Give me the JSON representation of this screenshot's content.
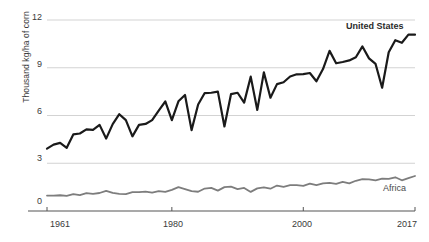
{
  "chart_data": {
    "type": "line",
    "title": "",
    "subtitle": "",
    "xlabel": "",
    "ylabel": "Thousand kg/ha of corn",
    "xlim": [
      1961,
      2017
    ],
    "ylim": [
      0,
      12
    ],
    "grid": true,
    "gridlines_y": [
      3,
      6,
      9,
      12
    ],
    "legend_position": "inline-right",
    "y_ticks": [
      "0",
      "3",
      "6",
      "9",
      "12"
    ],
    "y_tick_values": [
      0,
      3,
      6,
      9,
      12
    ],
    "x_ticks": [
      "1961",
      "1980",
      "2000",
      "2017"
    ],
    "x_tick_values": [
      1961,
      1980,
      2000,
      2017
    ],
    "x": [
      1961,
      1962,
      1963,
      1964,
      1965,
      1966,
      1967,
      1968,
      1969,
      1970,
      1971,
      1972,
      1973,
      1974,
      1975,
      1976,
      1977,
      1978,
      1979,
      1980,
      1981,
      1982,
      1983,
      1984,
      1985,
      1986,
      1987,
      1988,
      1989,
      1990,
      1991,
      1992,
      1993,
      1994,
      1995,
      1996,
      1997,
      1998,
      1999,
      2000,
      2001,
      2002,
      2003,
      2004,
      2005,
      2006,
      2007,
      2008,
      2009,
      2010,
      2011,
      2012,
      2013,
      2014,
      2015,
      2016,
      2017
    ],
    "series": [
      {
        "name": "United States",
        "color": "#1a1a1a",
        "width": 2.2,
        "label_x": 2011,
        "label_y": 11.4,
        "values": [
          3.92,
          4.17,
          4.28,
          3.97,
          4.81,
          4.87,
          5.13,
          5.1,
          5.41,
          4.55,
          5.46,
          6.08,
          5.71,
          4.69,
          5.41,
          5.47,
          5.71,
          6.31,
          6.88,
          5.71,
          6.89,
          7.29,
          5.08,
          6.69,
          7.41,
          7.43,
          7.5,
          5.31,
          7.34,
          7.43,
          6.81,
          8.44,
          6.35,
          8.71,
          7.12,
          7.97,
          8.09,
          8.45,
          8.59,
          8.6,
          8.67,
          8.15,
          8.92,
          10.06,
          9.28,
          9.36,
          9.46,
          9.66,
          10.34,
          9.59,
          9.24,
          7.74,
          9.97,
          10.73,
          10.57,
          11.08,
          11.08
        ]
      },
      {
        "name": "Africa",
        "color": "#7d7d7d",
        "width": 1.8,
        "label_x": 2010,
        "label_y": 1.15,
        "values": [
          0.97,
          0.97,
          0.99,
          0.95,
          1.06,
          1.0,
          1.12,
          1.08,
          1.13,
          1.27,
          1.14,
          1.08,
          1.06,
          1.18,
          1.18,
          1.22,
          1.15,
          1.25,
          1.2,
          1.33,
          1.5,
          1.38,
          1.25,
          1.21,
          1.41,
          1.45,
          1.28,
          1.5,
          1.53,
          1.38,
          1.45,
          1.2,
          1.42,
          1.48,
          1.4,
          1.6,
          1.52,
          1.62,
          1.62,
          1.58,
          1.72,
          1.62,
          1.73,
          1.77,
          1.71,
          1.83,
          1.74,
          1.9,
          2.0,
          1.99,
          1.93,
          2.04,
          2.02,
          2.12,
          1.93,
          2.06,
          2.2
        ]
      }
    ]
  },
  "axis": {
    "y_title": "Thousand kg/ha of corn",
    "y_labels": {
      "t0": "0",
      "t3": "3",
      "t6": "6",
      "t9": "9",
      "t12": "12"
    },
    "x_labels": {
      "start": "1961",
      "mid1": "1980",
      "mid2": "2000",
      "end": "2017"
    }
  },
  "labels": {
    "series_us": "United States",
    "series_africa": "Africa"
  },
  "colors": {
    "us_line": "#1a1a1a",
    "africa_line": "#7d7d7d",
    "gridline": "#c8c8c8",
    "axis": "#555555",
    "text": "#3a3a3a",
    "background": "#ffffff"
  }
}
